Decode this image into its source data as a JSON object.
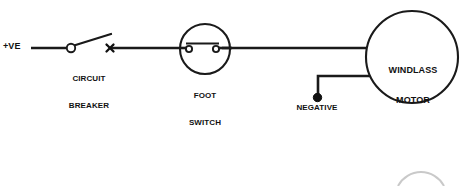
{
  "diagram": {
    "type": "electrical-schematic",
    "background_color": "#ffffff",
    "line_color": "#1a1a1a",
    "labels": {
      "positive_supply": "+VE",
      "circuit_breaker_line1": "CIRCUIT",
      "circuit_breaker_line2": "BREAKER",
      "foot_switch_line1": "FOOT",
      "foot_switch_line2": "SWITCH",
      "negative_terminal": "NEGATIVE",
      "motor_line1": "WINDLASS",
      "motor_line2": "MOTOR"
    },
    "components": [
      {
        "name": "positive-supply-terminal",
        "label": "+VE",
        "symbol": "wire-lead",
        "x": 12,
        "y": 48
      },
      {
        "name": "circuit-breaker",
        "label": "CIRCUIT BREAKER",
        "symbol": "open-switch-with-cross",
        "pivot_x": 71,
        "pivot_y": 48,
        "arm_end_x": 110,
        "arm_end_y": 35,
        "cross_x": 110,
        "cross_y": 48
      },
      {
        "name": "foot-switch",
        "label": "FOOT SWITCH",
        "symbol": "circle-with-two-terminals-and-contact-bar",
        "center_x": 205,
        "center_y": 49,
        "radius": 25
      },
      {
        "name": "negative-terminal",
        "label": "NEGATIVE",
        "symbol": "filled-dot",
        "x": 317,
        "y": 98
      },
      {
        "name": "windlass-motor",
        "label": "WINDLASS MOTOR",
        "symbol": "large-circle",
        "center_x": 412,
        "center_y": 57,
        "radius": 46
      }
    ],
    "connections": [
      {
        "name": "supply-to-breaker",
        "from": "positive-supply-terminal",
        "to": "circuit-breaker"
      },
      {
        "name": "breaker-to-foot-switch",
        "from": "circuit-breaker",
        "to": "foot-switch"
      },
      {
        "name": "foot-switch-to-motor",
        "from": "foot-switch",
        "to": "windlass-motor"
      },
      {
        "name": "motor-to-negative",
        "from": "windlass-motor",
        "to": "negative-terminal"
      }
    ]
  }
}
